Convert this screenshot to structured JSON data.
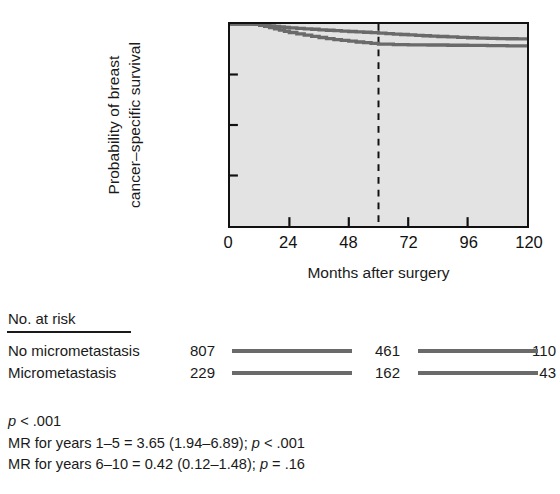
{
  "axes": {
    "y_title_line1": "Probability of breast",
    "y_title_line2": "cancer–specific survival",
    "x_title": "Months after surgery",
    "y_ticks": [
      "1",
      "0.75",
      "0.50",
      "0.25",
      "0"
    ],
    "y_tick_values": [
      1,
      0.75,
      0.5,
      0.25,
      0
    ],
    "x_ticks": [
      "0",
      "24",
      "48",
      "72",
      "96",
      "120"
    ],
    "x_tick_values": [
      0,
      24,
      48,
      72,
      96,
      120
    ]
  },
  "risk_table": {
    "header": "No. at risk",
    "rows": [
      {
        "label": "No micrometastasis",
        "counts": [
          "807",
          "461",
          "110"
        ]
      },
      {
        "label": "Micrometastasis",
        "counts": [
          "229",
          "162",
          "43"
        ]
      }
    ]
  },
  "stats": {
    "line1_p": "p",
    "line1_rest": " < .001",
    "line2_pre": "MR for years 1–5 = 3.65 (1.94–6.89); ",
    "line2_p": "p",
    "line2_post": " < .001",
    "line3_pre": "MR for years 6–10 = 0.42 (0.12–1.48); ",
    "line3_p": "p",
    "line3_post": " = .16"
  },
  "colors": {
    "curve": "#6a6a6a",
    "plot_bg": "#e3e3e3",
    "axis": "#111111",
    "text": "#1a1a1a"
  },
  "chart_data": {
    "type": "line",
    "title": "",
    "xlabel": "Months after surgery",
    "ylabel": "Probability of breast cancer–specific survival",
    "xlim": [
      0,
      120
    ],
    "ylim": [
      0,
      1
    ],
    "grid": false,
    "legend": "none",
    "annotations": [
      {
        "type": "vline",
        "x": 60,
        "style": "dashed",
        "label": ""
      }
    ],
    "series": [
      {
        "name": "No micrometastasis",
        "x": [
          0,
          6,
          10,
          12,
          14,
          16,
          18,
          20,
          22,
          24,
          27,
          30,
          33,
          36,
          39,
          42,
          45,
          48,
          51,
          54,
          57,
          60,
          63,
          66,
          69,
          72,
          75,
          78,
          81,
          84,
          88,
          92,
          96,
          100,
          104,
          108,
          112,
          116,
          120
        ],
        "y": [
          1.0,
          1.0,
          0.999,
          0.997,
          0.994,
          0.991,
          0.988,
          0.985,
          0.983,
          0.981,
          0.978,
          0.976,
          0.974,
          0.971,
          0.969,
          0.967,
          0.965,
          0.963,
          0.961,
          0.959,
          0.957,
          0.955,
          0.952,
          0.95,
          0.948,
          0.946,
          0.944,
          0.942,
          0.94,
          0.938,
          0.936,
          0.934,
          0.932,
          0.93,
          0.929,
          0.928,
          0.927,
          0.926,
          0.925
        ]
      },
      {
        "name": "Micrometastasis",
        "x": [
          0,
          6,
          10,
          12,
          14,
          16,
          18,
          20,
          22,
          24,
          27,
          30,
          33,
          36,
          39,
          42,
          45,
          48,
          51,
          54,
          57,
          60,
          66,
          72,
          80,
          88,
          96,
          104,
          112,
          120
        ],
        "y": [
          1.0,
          1.0,
          0.998,
          0.994,
          0.988,
          0.982,
          0.976,
          0.97,
          0.964,
          0.958,
          0.951,
          0.945,
          0.939,
          0.933,
          0.928,
          0.923,
          0.919,
          0.915,
          0.911,
          0.908,
          0.904,
          0.9,
          0.898,
          0.897,
          0.896,
          0.895,
          0.894,
          0.893,
          0.892,
          0.891
        ]
      }
    ]
  }
}
